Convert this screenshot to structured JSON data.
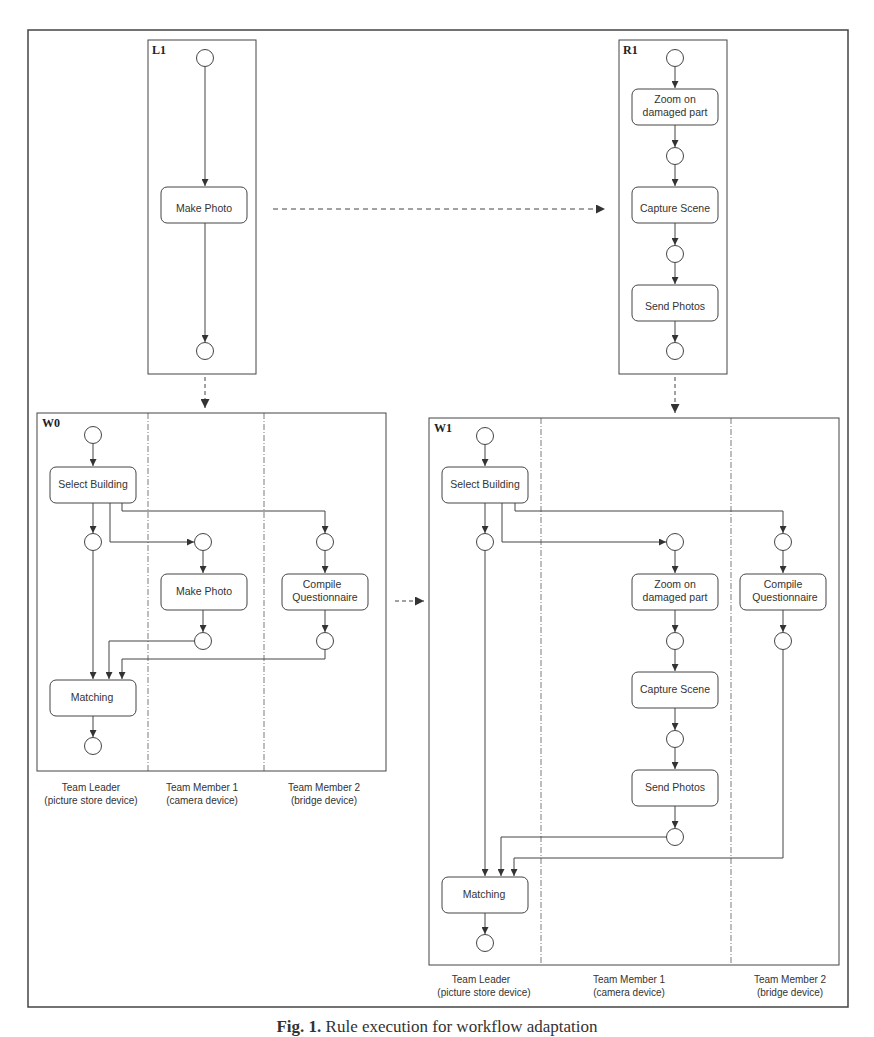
{
  "caption": {
    "prefix": "Fig. 1.",
    "text": "Rule execution for workflow adaptation"
  },
  "L1": {
    "title": "L1",
    "activities": [
      "Make Photo"
    ]
  },
  "R1": {
    "title": "R1",
    "activities": [
      [
        "Zoom on",
        "damaged part"
      ],
      "Capture Scene",
      "Send Photos"
    ]
  },
  "W0": {
    "title": "W0",
    "activities": {
      "select": "Select Building",
      "photo": "Make Photo",
      "compile": [
        "Compile",
        "Questionnaire"
      ],
      "match": "Matching"
    },
    "lanes": [
      [
        "Team Leader",
        "(picture store device)"
      ],
      [
        "Team Member 1",
        "(camera device)"
      ],
      [
        "Team Member 2",
        "(bridge device)"
      ]
    ]
  },
  "W1": {
    "title": "W1",
    "activities": {
      "select": "Select Building",
      "zoom": [
        "Zoom on",
        "damaged part"
      ],
      "capture": "Capture Scene",
      "send": "Send Photos",
      "compile": [
        "Compile",
        "Questionnaire"
      ],
      "match": "Matching"
    },
    "lanes": [
      [
        "Team Leader",
        "(picture store device)"
      ],
      [
        "Team Member 1",
        "(camera device)"
      ],
      [
        "Team Member 2",
        "(bridge device)"
      ]
    ]
  }
}
